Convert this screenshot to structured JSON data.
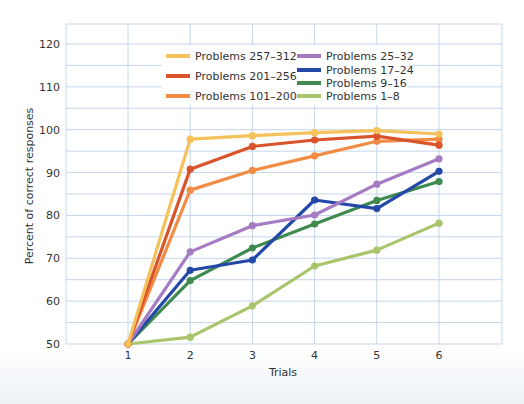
{
  "chart_data": {
    "type": "line",
    "title": "",
    "xlabel": "Trials",
    "ylabel": "Percent of correct responses",
    "x": [
      1,
      2,
      3,
      4,
      5,
      6
    ],
    "xticks": [
      "1",
      "2",
      "3",
      "4",
      "5",
      "6"
    ],
    "xlim": [
      0,
      7
    ],
    "yticks": [
      50,
      60,
      70,
      80,
      90,
      100,
      110,
      120
    ],
    "ylim": [
      50,
      125
    ],
    "grid": true,
    "grid_step_y": 5,
    "legend_position": "upper center (inside plot)",
    "series": [
      {
        "name": "Problems 257–312",
        "color": "#f5c15a",
        "values": [
          50,
          97.8,
          98.6,
          99.3,
          99.8,
          99.0
        ]
      },
      {
        "name": "Problems 201–256",
        "color": "#d9532b",
        "values": [
          50,
          90.8,
          96.1,
          97.6,
          98.5,
          96.4
        ]
      },
      {
        "name": "Problems 101–200",
        "color": "#f28c45",
        "values": [
          50,
          85.9,
          90.5,
          93.9,
          97.3,
          97.8
        ]
      },
      {
        "name": "Problems 25–32",
        "color": "#a57cc4",
        "values": [
          50,
          71.5,
          77.6,
          80.1,
          87.3,
          93.2
        ]
      },
      {
        "name": "Problems 17–24",
        "color": "#2448a8",
        "values": [
          50,
          67.2,
          69.6,
          83.6,
          81.6,
          90.3
        ]
      },
      {
        "name": "Problems 9–16",
        "color": "#3f8a4f",
        "values": [
          50,
          64.8,
          72.4,
          78.0,
          83.5,
          87.9
        ]
      },
      {
        "name": "Problems 1–8",
        "color": "#a9c56b",
        "values": [
          50,
          51.6,
          58.9,
          68.2,
          71.9,
          78.2
        ]
      }
    ]
  },
  "colors": {
    "grid": "#c5d5ea",
    "plot_background": "#ffffff",
    "text": "#333333"
  }
}
